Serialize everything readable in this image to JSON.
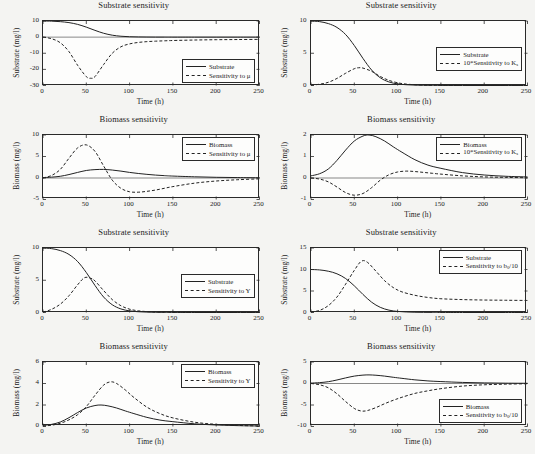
{
  "figure": {
    "width": 535,
    "height": 454,
    "background": "#f4f4f2",
    "line_color": "#222222",
    "rows": 4,
    "cols": 2
  },
  "chart_data": [
    {
      "id": "p1",
      "type": "line",
      "title": "Substrate sensitivity",
      "xlabel": "Time (h)",
      "ylabel": "Substrate (mg/l)",
      "xlim": [
        0,
        250
      ],
      "ylim": [
        -30,
        10
      ],
      "xticks": [
        0,
        50,
        100,
        150,
        200,
        250
      ],
      "yticks": [
        10,
        0,
        -10,
        -20,
        -30
      ],
      "grid": false,
      "legend_position": "lower-right",
      "series": [
        {
          "name": "Substrate",
          "style": "solid",
          "x": [
            0,
            10,
            20,
            30,
            40,
            50,
            60,
            70,
            80,
            90,
            100,
            110,
            120,
            130,
            140,
            150,
            175,
            200,
            225,
            250
          ],
          "values": [
            10,
            9.9,
            9.6,
            9.0,
            7.9,
            6.2,
            4.2,
            2.4,
            1.2,
            0.55,
            0.25,
            0.12,
            0.06,
            0.03,
            0.02,
            0.01,
            0.0,
            0.0,
            0.0,
            0.0
          ]
        },
        {
          "name": "Sensitivity to μ",
          "style": "dashed",
          "x": [
            0,
            10,
            20,
            30,
            40,
            50,
            55,
            60,
            70,
            80,
            90,
            100,
            110,
            120,
            130,
            140,
            150,
            175,
            200,
            225,
            250
          ],
          "values": [
            0,
            -1.0,
            -3.5,
            -9.0,
            -17.5,
            -24.5,
            -25.5,
            -24.5,
            -17.0,
            -10.0,
            -6.0,
            -4.2,
            -3.3,
            -2.8,
            -2.5,
            -2.3,
            -2.1,
            -1.8,
            -1.6,
            -1.5,
            -1.4
          ]
        }
      ]
    },
    {
      "id": "p2",
      "type": "line",
      "title": "Substrate sensitivity",
      "xlabel": "Time (h)",
      "ylabel": "Substrate (mg/l)",
      "xlim": [
        0,
        250
      ],
      "ylim": [
        0,
        10
      ],
      "xticks": [
        0,
        50,
        100,
        150,
        200,
        250
      ],
      "yticks": [
        10,
        5,
        0
      ],
      "grid": false,
      "legend_position": "middle-right",
      "series": [
        {
          "name": "Substrate",
          "style": "solid",
          "x": [
            0,
            10,
            20,
            30,
            40,
            50,
            60,
            70,
            80,
            90,
            100,
            110,
            120,
            130,
            140,
            150,
            175,
            200,
            225,
            250
          ],
          "values": [
            10,
            9.9,
            9.6,
            9.0,
            7.9,
            6.2,
            4.2,
            2.4,
            1.2,
            0.55,
            0.25,
            0.12,
            0.06,
            0.03,
            0.02,
            0.01,
            0.0,
            0.0,
            0.0,
            0.0
          ]
        },
        {
          "name": "10*Sensitivity to K<sub>s</sub>",
          "style": "dashed",
          "x": [
            0,
            10,
            20,
            30,
            40,
            50,
            55,
            60,
            70,
            80,
            90,
            100,
            110,
            120,
            130,
            140,
            150,
            175,
            200,
            225,
            250
          ],
          "values": [
            0.05,
            0.2,
            0.5,
            1.1,
            1.9,
            2.6,
            2.75,
            2.7,
            2.2,
            1.4,
            0.8,
            0.42,
            0.22,
            0.12,
            0.07,
            0.04,
            0.02,
            0.01,
            0.0,
            0.0,
            0.0
          ]
        }
      ]
    },
    {
      "id": "p3",
      "type": "line",
      "title": "Biomass sensitivity",
      "xlabel": "Time (h)",
      "ylabel": "Biomass (mg/l)",
      "xlim": [
        0,
        250
      ],
      "ylim": [
        -5,
        10
      ],
      "xticks": [
        0,
        50,
        100,
        150,
        200,
        250
      ],
      "yticks": [
        10,
        5,
        0,
        -5
      ],
      "grid": false,
      "legend_position": "upper-right",
      "series": [
        {
          "name": "Biomass",
          "style": "solid",
          "x": [
            0,
            10,
            20,
            30,
            40,
            50,
            60,
            70,
            80,
            90,
            100,
            110,
            120,
            130,
            140,
            150,
            175,
            200,
            225,
            250
          ],
          "values": [
            0.1,
            0.2,
            0.4,
            0.8,
            1.3,
            1.75,
            1.95,
            2.0,
            1.85,
            1.6,
            1.3,
            1.05,
            0.85,
            0.68,
            0.55,
            0.45,
            0.28,
            0.16,
            0.1,
            0.06
          ]
        },
        {
          "name": "Sensitivity to μ",
          "style": "dashed",
          "x": [
            0,
            10,
            20,
            30,
            40,
            50,
            60,
            70,
            80,
            90,
            100,
            110,
            120,
            130,
            140,
            150,
            175,
            200,
            225,
            250
          ],
          "values": [
            0,
            0.6,
            2.0,
            4.6,
            7.0,
            7.7,
            6.2,
            2.8,
            -0.5,
            -2.4,
            -3.2,
            -3.3,
            -3.1,
            -2.8,
            -2.4,
            -2.0,
            -1.2,
            -0.7,
            -0.4,
            -0.2
          ]
        }
      ]
    },
    {
      "id": "p4",
      "type": "line",
      "title": "Biomass sensitivity",
      "xlabel": "Time (h)",
      "ylabel": "Biomass (mg/l)",
      "xlim": [
        0,
        250
      ],
      "ylim": [
        -1,
        2
      ],
      "xticks": [
        0,
        50,
        100,
        150,
        200,
        250
      ],
      "yticks": [
        2,
        1,
        0,
        -1
      ],
      "grid": false,
      "legend_position": "upper-right",
      "series": [
        {
          "name": "Biomass",
          "style": "solid",
          "x": [
            0,
            10,
            20,
            30,
            40,
            50,
            60,
            67,
            75,
            85,
            95,
            105,
            120,
            135,
            150,
            175,
            200,
            225,
            250
          ],
          "values": [
            0.1,
            0.2,
            0.42,
            0.82,
            1.3,
            1.72,
            1.95,
            2.0,
            1.92,
            1.72,
            1.45,
            1.2,
            0.85,
            0.6,
            0.45,
            0.25,
            0.14,
            0.08,
            0.05
          ]
        },
        {
          "name": "10*Sensitivity to K<sub>s</sub>",
          "style": "dashed",
          "x": [
            0,
            10,
            20,
            30,
            40,
            50,
            60,
            70,
            80,
            90,
            100,
            110,
            120,
            130,
            140,
            150,
            175,
            200,
            225,
            250
          ],
          "values": [
            0,
            -0.05,
            -0.18,
            -0.42,
            -0.68,
            -0.8,
            -0.72,
            -0.45,
            -0.1,
            0.15,
            0.28,
            0.32,
            0.3,
            0.26,
            0.22,
            0.18,
            0.1,
            0.05,
            0.03,
            0.01
          ]
        }
      ]
    },
    {
      "id": "p5",
      "type": "line",
      "title": "Substrate sensitivity",
      "xlabel": "Time (h)",
      "ylabel": "Substrate (mg/l)",
      "xlim": [
        0,
        250
      ],
      "ylim": [
        0,
        10
      ],
      "xticks": [
        0,
        50,
        100,
        150,
        200,
        250
      ],
      "yticks": [
        10,
        5,
        0
      ],
      "grid": false,
      "legend_position": "middle-right",
      "series": [
        {
          "name": "Substrate",
          "style": "solid",
          "x": [
            0,
            10,
            20,
            30,
            40,
            50,
            60,
            70,
            80,
            90,
            100,
            110,
            120,
            130,
            140,
            150,
            175,
            200,
            225,
            250
          ],
          "values": [
            10,
            9.9,
            9.6,
            9.0,
            7.9,
            6.2,
            4.2,
            2.4,
            1.2,
            0.55,
            0.25,
            0.12,
            0.06,
            0.03,
            0.02,
            0.01,
            0.0,
            0.0,
            0.0,
            0.0
          ]
        },
        {
          "name": "Sensitivity to Y",
          "style": "dashed",
          "x": [
            0,
            10,
            20,
            30,
            40,
            48,
            55,
            60,
            70,
            80,
            90,
            100,
            110,
            120,
            130,
            140,
            150,
            175,
            200,
            225,
            250
          ],
          "values": [
            0.05,
            0.5,
            1.3,
            2.6,
            4.3,
            5.4,
            5.3,
            4.9,
            3.4,
            2.0,
            1.05,
            0.52,
            0.26,
            0.14,
            0.08,
            0.05,
            0.03,
            0.01,
            0.0,
            0.0,
            0.0
          ]
        }
      ]
    },
    {
      "id": "p6",
      "type": "line",
      "title": "Substrate sensitivity",
      "xlabel": "Time (h)",
      "ylabel": "Substrate (mg/l)",
      "xlim": [
        0,
        250
      ],
      "ylim": [
        0,
        15
      ],
      "xticks": [
        0,
        50,
        100,
        150,
        200,
        250
      ],
      "yticks": [
        15,
        10,
        5,
        0
      ],
      "grid": false,
      "legend_position": "upper-right",
      "series": [
        {
          "name": "Substrate",
          "style": "solid",
          "x": [
            0,
            10,
            20,
            30,
            40,
            50,
            60,
            70,
            80,
            90,
            100,
            110,
            120,
            130,
            140,
            150,
            175,
            200,
            225,
            250
          ],
          "values": [
            10,
            9.9,
            9.6,
            9.0,
            7.9,
            6.2,
            4.2,
            2.4,
            1.2,
            0.55,
            0.25,
            0.12,
            0.06,
            0.03,
            0.02,
            0.01,
            0.0,
            0.0,
            0.0,
            0.0
          ]
        },
        {
          "name": "Sensitivity to b<sub>0</sub>/10",
          "style": "dashed",
          "x": [
            0,
            10,
            20,
            30,
            40,
            50,
            58,
            65,
            75,
            85,
            95,
            105,
            120,
            135,
            150,
            175,
            200,
            225,
            250
          ],
          "values": [
            0.1,
            0.5,
            1.6,
            3.6,
            6.6,
            9.8,
            11.9,
            11.7,
            9.6,
            7.4,
            5.8,
            4.8,
            4.0,
            3.5,
            3.2,
            3.0,
            2.9,
            2.85,
            2.8
          ]
        }
      ]
    },
    {
      "id": "p7",
      "type": "line",
      "title": "Biomass sensitivity",
      "xlabel": "Time (h)",
      "ylabel": "Biomass (mg/l)",
      "xlim": [
        0,
        250
      ],
      "ylim": [
        0,
        6
      ],
      "xticks": [
        0,
        50,
        100,
        150,
        200,
        250
      ],
      "yticks": [
        6,
        4,
        2,
        0
      ],
      "grid": false,
      "legend_position": "upper-right",
      "series": [
        {
          "name": "Biomass",
          "style": "solid",
          "x": [
            0,
            10,
            20,
            30,
            40,
            50,
            60,
            67,
            75,
            85,
            95,
            105,
            120,
            135,
            150,
            175,
            200,
            225,
            250
          ],
          "values": [
            0.1,
            0.2,
            0.42,
            0.82,
            1.3,
            1.72,
            1.95,
            2.0,
            1.92,
            1.72,
            1.45,
            1.2,
            0.85,
            0.6,
            0.45,
            0.25,
            0.14,
            0.08,
            0.05
          ]
        },
        {
          "name": "Sensitivity to Y",
          "style": "dashed",
          "x": [
            0,
            10,
            20,
            30,
            40,
            50,
            60,
            70,
            78,
            85,
            95,
            105,
            120,
            135,
            150,
            175,
            200,
            225,
            250
          ],
          "values": [
            0.05,
            0.12,
            0.3,
            0.62,
            1.1,
            1.85,
            2.9,
            3.85,
            4.15,
            4.0,
            3.4,
            2.7,
            1.8,
            1.2,
            0.8,
            0.4,
            0.2,
            0.1,
            0.05
          ]
        }
      ]
    },
    {
      "id": "p8",
      "type": "line",
      "title": "Biomass sensitivity",
      "xlabel": "Time (h)",
      "ylabel": "Biomass (mg/l)",
      "xlim": [
        0,
        250
      ],
      "ylim": [
        -10,
        5
      ],
      "xticks": [
        0,
        50,
        100,
        150,
        200,
        250
      ],
      "yticks": [
        5,
        0,
        -5,
        -10
      ],
      "grid": false,
      "legend_position": "lower-right",
      "series": [
        {
          "name": "Biomass",
          "style": "solid",
          "x": [
            0,
            10,
            20,
            30,
            40,
            50,
            60,
            67,
            75,
            85,
            95,
            105,
            120,
            135,
            150,
            175,
            200,
            225,
            250
          ],
          "values": [
            0.1,
            0.2,
            0.42,
            0.82,
            1.3,
            1.72,
            1.95,
            2.0,
            1.92,
            1.72,
            1.45,
            1.2,
            0.85,
            0.6,
            0.45,
            0.25,
            0.14,
            0.08,
            0.05
          ]
        },
        {
          "name": "Sensitivity to b<sub>0</sub>/10",
          "style": "dashed",
          "x": [
            0,
            10,
            20,
            30,
            40,
            50,
            58,
            65,
            75,
            85,
            95,
            105,
            120,
            135,
            150,
            175,
            200,
            225,
            250
          ],
          "values": [
            0,
            -0.3,
            -1.0,
            -2.4,
            -4.2,
            -5.8,
            -6.4,
            -6.3,
            -5.6,
            -4.7,
            -3.9,
            -3.2,
            -2.3,
            -1.7,
            -1.2,
            -0.6,
            -0.3,
            -0.15,
            -0.05
          ]
        }
      ]
    }
  ]
}
